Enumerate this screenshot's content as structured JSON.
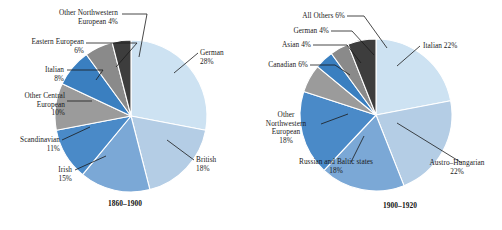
{
  "chart_data": [
    {
      "type": "pie",
      "title": "1860–1900",
      "caption": "1860–1900",
      "legend": "none",
      "start_angle_deg": 0,
      "direction": "clockwise",
      "categories": [
        "German",
        "British",
        "Irish",
        "Scandinavian",
        "Other Central European",
        "Italian",
        "Eastern European",
        "Other Northwestern European"
      ],
      "values": [
        28,
        18,
        15,
        11,
        10,
        8,
        6,
        4
      ],
      "unit": "%",
      "colors": [
        "#cde2f2",
        "#b4cde5",
        "#7ba8d6",
        "#4a8ac8",
        "#9b9b9b",
        "#3a7fc0",
        "#8a8a8a",
        "#3d3d3d"
      ],
      "slices": [
        {
          "label": "German",
          "value": 28,
          "text": "German\n28%",
          "color": "#cde2f2"
        },
        {
          "label": "British",
          "value": 18,
          "text": "British\n18%",
          "color": "#b4cde5"
        },
        {
          "label": "Irish",
          "value": 15,
          "text": "Irish\n15%",
          "color": "#7ba8d6"
        },
        {
          "label": "Scandinavian",
          "value": 11,
          "text": "Scandinavian\n11%",
          "color": "#4a8ac8"
        },
        {
          "label": "Other Central European",
          "value": 10,
          "text": "Other Central\nEuropean\n10%",
          "color": "#9b9b9b"
        },
        {
          "label": "Italian",
          "value": 8,
          "text": "Italian\n8%",
          "color": "#3a7fc0"
        },
        {
          "label": "Eastern European",
          "value": 6,
          "text": "Eastern European\n6%",
          "color": "#8a8a8a"
        },
        {
          "label": "Other Northwestern European",
          "value": 4,
          "text": "Other Northwestern\nEuropean 4%",
          "color": "#3d3d3d"
        }
      ]
    },
    {
      "type": "pie",
      "title": "1900–1920",
      "caption": "1900–1920",
      "legend": "none",
      "start_angle_deg": 0,
      "direction": "clockwise",
      "categories": [
        "Italian",
        "Austro-Hungarian",
        "Russian and Baltic states",
        "Other Northwestern European",
        "Canadian",
        "Asian",
        "German",
        "All Others"
      ],
      "values": [
        22,
        22,
        18,
        18,
        6,
        4,
        4,
        6
      ],
      "unit": "%",
      "colors": [
        "#cde2f2",
        "#b4cde5",
        "#7ba8d6",
        "#4a8ac8",
        "#9b9b9b",
        "#3a7fc0",
        "#8a8a8a",
        "#3d3d3d"
      ],
      "slices": [
        {
          "label": "Italian",
          "value": 22,
          "text": "Italian 22%",
          "color": "#cde2f2"
        },
        {
          "label": "Austro-Hungarian",
          "value": 22,
          "text": "Austro–Hungarian\n22%",
          "color": "#b4cde5"
        },
        {
          "label": "Russian and Baltic states",
          "value": 18,
          "text": "Russian and Baltic states\n18%",
          "color": "#7ba8d6"
        },
        {
          "label": "Other Northwestern European",
          "value": 18,
          "text": "Other\nNorthwestern\nEuropean\n18%",
          "color": "#4a8ac8"
        },
        {
          "label": "Canadian",
          "value": 6,
          "text": "Canadian 6%",
          "color": "#9b9b9b"
        },
        {
          "label": "Asian",
          "value": 4,
          "text": "Asian 4%",
          "color": "#3a7fc0"
        },
        {
          "label": "German",
          "value": 4,
          "text": "German 4%",
          "color": "#8a8a8a"
        },
        {
          "label": "All Others",
          "value": 6,
          "text": "All Others 6%",
          "color": "#3d3d3d"
        }
      ]
    }
  ]
}
